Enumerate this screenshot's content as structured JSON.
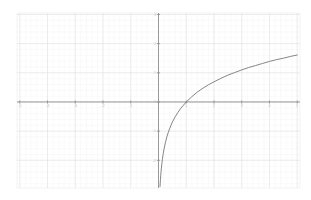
{
  "figure": {
    "background_color": "#ffffff",
    "width": 311,
    "height": 200
  },
  "style": {
    "major_grid_color": "#e3e3e3",
    "minor_grid_color": "#f2f2f2",
    "axis_color": "#9a9a9a",
    "tick_color": "#8f8f8f",
    "curve_color": "#6f6f6f",
    "label_color": "#b9b9b9",
    "frame_color": "#ebebeb"
  },
  "chart_data": {
    "type": "line",
    "title": "",
    "subtitle": "",
    "xlabel": "",
    "ylabel": "",
    "function": "y = ln(x)",
    "xlim": [
      -5.1,
      5.1
    ],
    "ylim": [
      -2.95,
      3.05
    ],
    "grid": true,
    "minor_grid": true,
    "legend": false,
    "legend_position": "none",
    "x_ticks": [
      -5,
      -4,
      -3,
      -2,
      -1,
      0,
      1,
      2,
      3,
      4,
      5
    ],
    "x_tick_labels": [
      "-5",
      "-4",
      "-3",
      "-2",
      "-1",
      "0",
      "1",
      "2",
      "3",
      "4",
      "5"
    ],
    "y_ticks": [
      -2,
      -1,
      0,
      1,
      2,
      3
    ],
    "y_tick_labels": [
      "-2",
      "-1",
      "0",
      "1",
      "2",
      "3"
    ],
    "vertical_asymptote": 0,
    "x_intercept": 1,
    "series": [
      {
        "name": "y = ln(x)",
        "color": "#6f6f6f",
        "x": [
          0.055,
          0.06,
          0.07,
          0.08,
          0.09,
          0.1,
          0.12,
          0.14,
          0.17,
          0.2,
          0.25,
          0.3,
          0.35,
          0.4,
          0.45,
          0.5,
          0.6,
          0.7,
          0.8,
          0.9,
          1.0,
          1.2,
          1.4,
          1.6,
          1.8,
          2.0,
          2.25,
          2.5,
          2.75,
          3.0,
          3.25,
          3.5,
          3.75,
          4.0,
          4.25,
          4.5,
          4.75,
          5.0
        ],
        "y": [
          -2.9,
          -2.81,
          -2.66,
          -2.53,
          -2.41,
          -2.3,
          -2.12,
          -1.97,
          -1.77,
          -1.61,
          -1.39,
          -1.2,
          -1.05,
          -0.92,
          -0.8,
          -0.69,
          -0.51,
          -0.36,
          -0.22,
          -0.11,
          0.0,
          0.18,
          0.34,
          0.47,
          0.59,
          0.69,
          0.81,
          0.92,
          1.01,
          1.1,
          1.18,
          1.25,
          1.32,
          1.39,
          1.45,
          1.5,
          1.56,
          1.61
        ]
      }
    ]
  }
}
